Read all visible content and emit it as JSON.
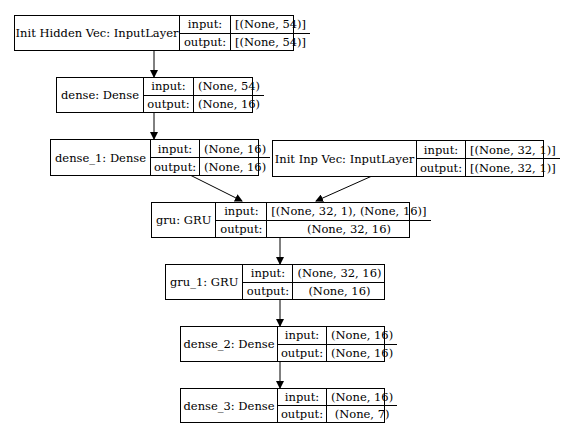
{
  "diagram": {
    "type": "keras-model-plot",
    "nodes": [
      {
        "id": "init_hidden",
        "label": "Init Hidden Vec: InputLayer",
        "input_label": "input:",
        "output_label": "output:",
        "input": "[(None, 54)]",
        "output": "[(None, 54)]"
      },
      {
        "id": "dense",
        "label": "dense: Dense",
        "input_label": "input:",
        "output_label": "output:",
        "input": "(None, 54)",
        "output": "(None, 16)"
      },
      {
        "id": "dense_1",
        "label": "dense_1: Dense",
        "input_label": "input:",
        "output_label": "output:",
        "input": "(None, 16)",
        "output": "(None, 16)"
      },
      {
        "id": "init_inp",
        "label": "Init Inp Vec: InputLayer",
        "input_label": "input:",
        "output_label": "output:",
        "input": "[(None, 32, 1)]",
        "output": "[(None, 32, 1)]"
      },
      {
        "id": "gru",
        "label": "gru: GRU",
        "input_label": "input:",
        "output_label": "output:",
        "input": "[(None, 32, 1), (None, 16)]",
        "output": "(None, 32, 16)"
      },
      {
        "id": "gru_1",
        "label": "gru_1: GRU",
        "input_label": "input:",
        "output_label": "output:",
        "input": "(None, 32, 16)",
        "output": "(None, 16)"
      },
      {
        "id": "dense_2",
        "label": "dense_2: Dense",
        "input_label": "input:",
        "output_label": "output:",
        "input": "(None, 16)",
        "output": "(None, 16)"
      },
      {
        "id": "dense_3",
        "label": "dense_3: Dense",
        "input_label": "input:",
        "output_label": "output:",
        "input": "(None, 16)",
        "output": "(None, 7)"
      }
    ],
    "edges": [
      {
        "from": "init_hidden",
        "to": "dense"
      },
      {
        "from": "dense",
        "to": "dense_1"
      },
      {
        "from": "dense_1",
        "to": "gru"
      },
      {
        "from": "init_inp",
        "to": "gru"
      },
      {
        "from": "gru",
        "to": "gru_1"
      },
      {
        "from": "gru_1",
        "to": "dense_2"
      },
      {
        "from": "dense_2",
        "to": "dense_3"
      }
    ]
  }
}
